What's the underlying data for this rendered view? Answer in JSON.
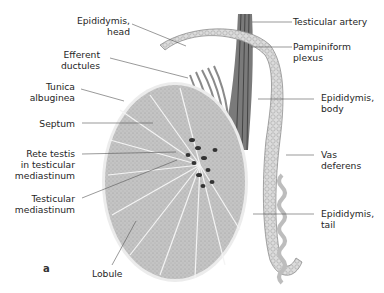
{
  "figure": {
    "panel_letter": "a"
  },
  "labels_left": [
    {
      "id": "epididymis-head",
      "line1": "Epididymis,",
      "line2": "head"
    },
    {
      "id": "efferent-ductules",
      "line1": "Efferent",
      "line2": "ductules"
    },
    {
      "id": "tunica-albuginea",
      "line1": "Tunica",
      "line2": "albuginea"
    },
    {
      "id": "septum",
      "line1": "Septum",
      "line2": ""
    },
    {
      "id": "rete-testis",
      "line1": "Rete testis",
      "line2": "in testicular",
      "line3": "mediastinum"
    },
    {
      "id": "testicular-mediastinum",
      "line1": "Testicular",
      "line2": "mediastinum"
    }
  ],
  "labels_bottom": [
    {
      "id": "lobule",
      "line1": "Lobule"
    }
  ],
  "labels_right": [
    {
      "id": "testicular-artery",
      "line1": "Testicular artery"
    },
    {
      "id": "pampiniform-plexus",
      "line1": "Pampiniform",
      "line2": "plexus"
    },
    {
      "id": "epididymis-body",
      "line1": "Epididymis,",
      "line2": "body"
    },
    {
      "id": "vas-deferens",
      "line1": "Vas",
      "line2": "deferens"
    },
    {
      "id": "epididymis-tail",
      "line1": "Epididymis,",
      "line2": "tail"
    }
  ],
  "colors": {
    "leader_line": "#555555",
    "tissue_fill": "#bdbdbd",
    "septum_line": "#f2f2f2",
    "tunica": "#e8e8e8",
    "epididymis": "#d9d9d9",
    "vessels": "#6e6e6e",
    "rete": "#3a3a3a"
  }
}
